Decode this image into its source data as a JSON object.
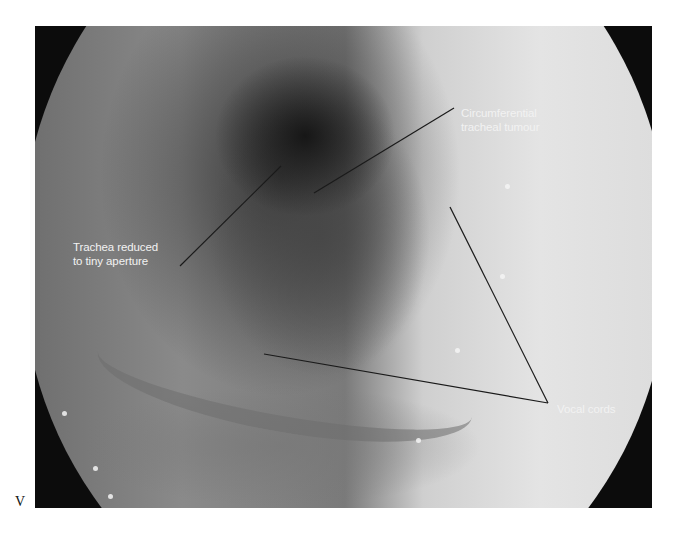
{
  "figure": {
    "annotations": [
      {
        "id": "tumour",
        "lines": [
          "Circumferential",
          "tracheal tumour"
        ]
      },
      {
        "id": "trachea",
        "lines": [
          "Trachea reduced",
          "to tiny aperture"
        ]
      },
      {
        "id": "vocal-cords",
        "lines": [
          "Vocal cords"
        ]
      }
    ],
    "stray_glyph": "V",
    "colors": {
      "label_text": "#f2f2f2",
      "leader_line": "#1a1a1a",
      "frame": "#0c0c0c",
      "page_bg": "#ffffff"
    }
  }
}
